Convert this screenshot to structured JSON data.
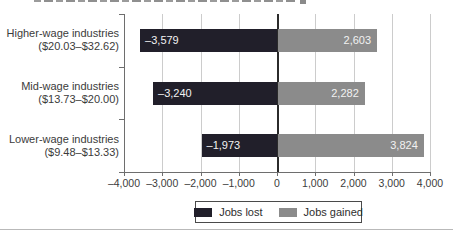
{
  "chart_data": {
    "type": "bar",
    "orientation": "horizontal",
    "diverging": true,
    "title": "",
    "categories": [
      {
        "label": "Higher-wage industries",
        "sublabel": "($20.03–$32.62)"
      },
      {
        "label": "Mid-wage industries",
        "sublabel": "($13.73–$20.00)"
      },
      {
        "label": "Lower-wage industries",
        "sublabel": "($9.48–$13.33)"
      }
    ],
    "series": [
      {
        "name": "Jobs lost",
        "color": "#211f2a",
        "values": [
          -3579,
          -3240,
          -1973
        ],
        "value_labels": [
          "–3,579",
          "–3,240",
          "–1,973"
        ]
      },
      {
        "name": "Jobs gained",
        "color": "#8b8b8b",
        "values": [
          2603,
          2282,
          3824
        ],
        "value_labels": [
          "2,603",
          "2,282",
          "3,824"
        ]
      }
    ],
    "xlim": [
      -4000,
      4000
    ],
    "xticks": [
      {
        "value": -4000,
        "label": "–4,000"
      },
      {
        "value": -3000,
        "label": "–3,000"
      },
      {
        "value": -2000,
        "label": "–2,000"
      },
      {
        "value": -1000,
        "label": "–1,000"
      },
      {
        "value": 0,
        "label": "0"
      },
      {
        "value": 1000,
        "label": "1,000"
      },
      {
        "value": 2000,
        "label": "2,000"
      },
      {
        "value": 3000,
        "label": "3,000"
      },
      {
        "value": 4000,
        "label": "4,000"
      }
    ],
    "grid": true,
    "legend_position": "bottom-center",
    "value_label_color": "#f2f2f2"
  },
  "colors": {
    "grid": "#cccccc",
    "axis": "#6e6e6e",
    "zero_line": "#2b2b2b",
    "text": "#3b3b3b",
    "legend_border": "#4a4a4a",
    "divider": "#b9b9b9",
    "background": "#ffffff"
  }
}
